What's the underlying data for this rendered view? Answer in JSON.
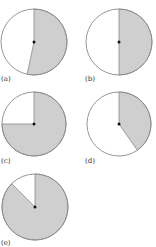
{
  "colors": {
    "shade": "#cfcfcf",
    "stroke": "#8a8a8a",
    "background": "#ffffff",
    "center_dot": "#111111"
  },
  "chart_data": {
    "type": "pie",
    "title": "",
    "panels": [
      {
        "label": "(a)",
        "shaded_fraction": 0.53,
        "start_deg": 0,
        "end_deg": 192,
        "cx": 34,
        "cy": 42,
        "r": 33
      },
      {
        "label": "(b)",
        "shaded_fraction": 0.5,
        "start_deg": 0,
        "end_deg": 180,
        "cx": 119,
        "cy": 42,
        "r": 33
      },
      {
        "label": "(c)",
        "shaded_fraction": 0.75,
        "start_deg": 0,
        "end_deg": 270,
        "cx": 34,
        "cy": 124,
        "r": 32
      },
      {
        "label": "(d)",
        "shaded_fraction": 0.4,
        "start_deg": 0,
        "end_deg": 145,
        "cx": 119,
        "cy": 124,
        "r": 32
      },
      {
        "label": "(e)",
        "shaded_fraction": 0.875,
        "start_deg": 0,
        "end_deg": 315,
        "cx": 35,
        "cy": 207,
        "r": 33
      }
    ]
  },
  "labels": {
    "a": "(a)",
    "b": "(b)",
    "c": "(c)",
    "d": "(d)",
    "e": "(e)"
  }
}
